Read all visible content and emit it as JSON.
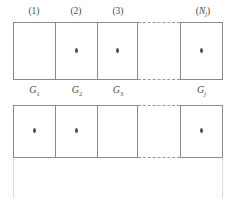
{
  "figure": {
    "colors": {
      "cell_border": "#8a8a8a",
      "dash": "#9a9a9a",
      "dot": "#4f4f4f",
      "drop_line": "#c2c2c2",
      "text": "#4a4a4a",
      "background": "#ffffff"
    }
  },
  "column_labels": [
    {
      "id": "col-1",
      "text": "(1)"
    },
    {
      "id": "col-2",
      "text": "(2)"
    },
    {
      "id": "col-3",
      "text": "(3)"
    },
    {
      "id": "col-n",
      "base": "N",
      "sub": "j",
      "open": "(",
      "close": ")"
    }
  ],
  "group_labels": [
    {
      "id": "group-1",
      "base": "G",
      "sub": "1"
    },
    {
      "id": "group-2",
      "base": "G",
      "sub": "2"
    },
    {
      "id": "group-3",
      "base": "G",
      "sub": "3"
    },
    {
      "id": "group-j",
      "base": "G",
      "sub": "j"
    }
  ],
  "rows": [
    {
      "id": "row-top",
      "cells": [
        {
          "id": "r1c1",
          "column": "(1)",
          "group": "G1",
          "marker": false
        },
        {
          "id": "r1c2",
          "column": "(2)",
          "group": "G2",
          "marker": true
        },
        {
          "id": "r1c3",
          "column": "(3)",
          "group": "G3",
          "marker": true
        },
        {
          "id": "r1cn",
          "column": "(Nj)",
          "group": "Gj",
          "marker": true
        }
      ],
      "ellipsis": true
    },
    {
      "id": "row-bottom",
      "cells": [
        {
          "id": "r2c1",
          "column": "(1)",
          "group": "G1",
          "marker": true
        },
        {
          "id": "r2c2",
          "column": "(2)",
          "group": "G2",
          "marker": true
        },
        {
          "id": "r2c3",
          "column": "(3)",
          "group": "G3",
          "marker": false
        },
        {
          "id": "r2cn",
          "column": "(Nj)",
          "group": "Gj",
          "marker": false,
          "marker_center": true
        }
      ],
      "ellipsis": true
    }
  ],
  "drop_lines": {
    "count": 2,
    "style": "dotted"
  }
}
